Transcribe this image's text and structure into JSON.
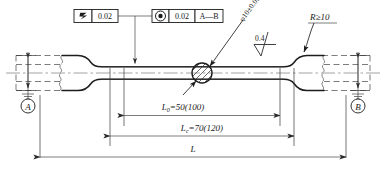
{
  "drawing": {
    "title": "Tensile test specimen dimensioned drawing",
    "colors": {
      "outline": "#1d1d1d",
      "thin_line": "#454545",
      "dashed_line": "#6d6d6d",
      "center_line": "#8a8a8a",
      "text": "#1a1a1a",
      "background": "#ffffff"
    },
    "feature_control_frames": [
      {
        "id": "straightness-frame",
        "symbol": "straightness-slash-icon",
        "tolerance": "0.02",
        "datum": ""
      },
      {
        "id": "concentricity-frame",
        "symbol": "concentricity-icon",
        "tolerance": "0.02",
        "datum": "A—B"
      }
    ],
    "annotations": {
      "diameter_callout": "φ10±0.05",
      "surface_roughness": "0.4",
      "radius_note": "R≥10"
    },
    "dimensions": [
      {
        "id": "gauge-length",
        "label_main": "L",
        "label_sub": "0",
        "value": "=50(100)"
      },
      {
        "id": "parallel-length",
        "label_main": "L",
        "label_sub": "c",
        "value": "=70(120)"
      },
      {
        "id": "total-length",
        "label_main": "L",
        "label_sub": "",
        "value": ""
      }
    ],
    "datums": [
      {
        "id": "datum-a",
        "letter": "A"
      },
      {
        "id": "datum-b",
        "letter": "B"
      }
    ]
  }
}
